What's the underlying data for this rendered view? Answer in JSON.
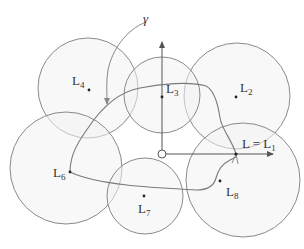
{
  "diagram": {
    "colors": {
      "circle_stroke": "#8a8a8a",
      "circle_fill": "#f4f4f4",
      "path_stroke": "#7a7a7a",
      "axis_stroke": "#555555",
      "text": "#333333"
    },
    "annotation": {
      "label": "γ"
    },
    "landmarks": [
      {
        "id": "L4",
        "base": "L",
        "sub": "4"
      },
      {
        "id": "L3",
        "base": "L",
        "sub": "3"
      },
      {
        "id": "L2",
        "base": "L",
        "sub": "2"
      },
      {
        "id": "L6",
        "base": "L",
        "sub": "6"
      },
      {
        "id": "L7",
        "base": "L",
        "sub": "7"
      },
      {
        "id": "L8",
        "base": "L",
        "sub": "8"
      },
      {
        "id": "L1",
        "base": "L = L",
        "sub": "1"
      }
    ]
  }
}
